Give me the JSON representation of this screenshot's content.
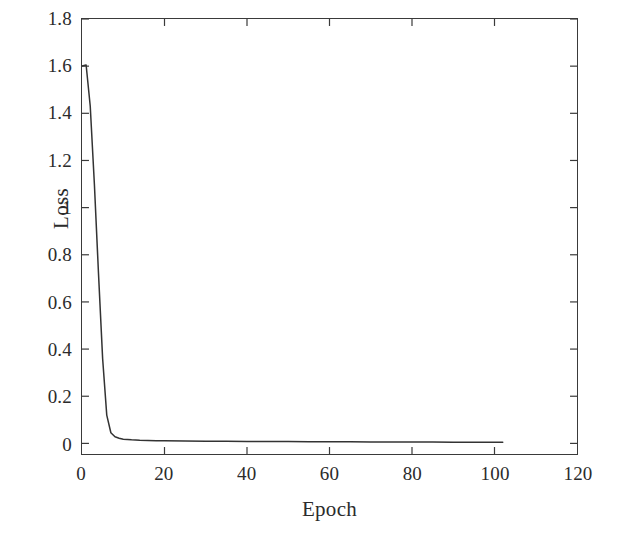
{
  "figure": {
    "background_color": "#ffffff",
    "frame_color": "#3a3a3a",
    "line_color": "#333333"
  },
  "chart_data": {
    "type": "line",
    "title": "",
    "xlabel": "Epoch",
    "ylabel": "Loss",
    "xlim": [
      0,
      120
    ],
    "ylim": [
      -0.045,
      1.8
    ],
    "grid": false,
    "legend": null,
    "xticks": [
      "0",
      "20",
      "40",
      "60",
      "80",
      "100",
      "120"
    ],
    "xtick_values": [
      0,
      20,
      40,
      60,
      80,
      100,
      120
    ],
    "yticks": [
      "0",
      "0.2",
      "0.4",
      "0.6",
      "0.8",
      "1",
      "1.2",
      "1.4",
      "1.6",
      "1.8"
    ],
    "ytick_values": [
      0,
      0.2,
      0.4,
      0.6,
      0.8,
      1,
      1.2,
      1.4,
      1.6,
      1.8
    ],
    "series": [
      {
        "name": "Training loss",
        "x": [
          0,
          1,
          2,
          3,
          4,
          5,
          6,
          7,
          8,
          9,
          10,
          12,
          14,
          16,
          18,
          20,
          25,
          30,
          35,
          40,
          45,
          50,
          55,
          60,
          65,
          70,
          75,
          80,
          85,
          90,
          95,
          100,
          102
        ],
        "y": [
          1.6,
          1.605,
          1.43,
          1.1,
          0.72,
          0.36,
          0.12,
          0.045,
          0.028,
          0.022,
          0.018,
          0.015,
          0.013,
          0.012,
          0.011,
          0.011,
          0.01,
          0.009,
          0.009,
          0.008,
          0.008,
          0.008,
          0.007,
          0.007,
          0.007,
          0.006,
          0.006,
          0.006,
          0.006,
          0.005,
          0.005,
          0.005,
          0.005
        ]
      }
    ]
  }
}
